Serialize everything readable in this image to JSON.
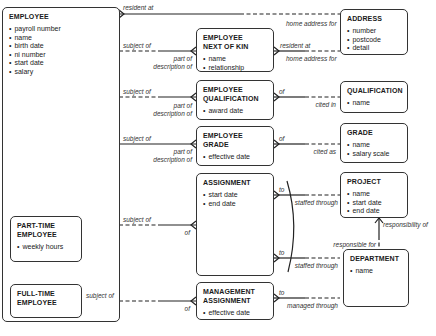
{
  "diagram": {
    "type": "entity-relationship",
    "entities": [
      {
        "id": "employee",
        "name": "EMPLOYEE",
        "attributes": [
          "payroll number",
          "name",
          "birth date",
          "ni number",
          "start date",
          "salary"
        ]
      },
      {
        "id": "part_time_employee",
        "name": "PART-TIME EMPLOYEE",
        "attributes": [
          "weekly hours"
        ]
      },
      {
        "id": "full_time_employee",
        "name": "FULL-TIME EMPLOYEE",
        "attributes": []
      },
      {
        "id": "employee_next_of_kin",
        "name": "EMPLOYEE NEXT OF KIN",
        "attributes": [
          "name",
          "relationship"
        ]
      },
      {
        "id": "employee_qualification",
        "name": "EMPLOYEE QUALIFICATION",
        "attributes": [
          "award date"
        ]
      },
      {
        "id": "employee_grade",
        "name": "EMPLOYEE GRADE",
        "attributes": [
          "effective date"
        ]
      },
      {
        "id": "assignment",
        "name": "ASSIGNMENT",
        "attributes": [
          "start date",
          "end date"
        ]
      },
      {
        "id": "management_assignment",
        "name": "MANAGEMENT ASSIGNMENT",
        "attributes": [
          "effective date"
        ]
      },
      {
        "id": "address",
        "name": "ADDRESS",
        "attributes": [
          "number",
          "postcode",
          "detail"
        ]
      },
      {
        "id": "qualification",
        "name": "QUALIFICATION",
        "attributes": [
          "name"
        ]
      },
      {
        "id": "grade",
        "name": "GRADE",
        "attributes": [
          "name",
          "salary scale"
        ]
      },
      {
        "id": "project",
        "name": "PROJECT",
        "attributes": [
          "name",
          "start date",
          "end date"
        ]
      },
      {
        "id": "department",
        "name": "DEPARTMENT",
        "attributes": [
          "name"
        ]
      }
    ],
    "relationships": [
      {
        "from": "employee",
        "to": "address",
        "from_label": "resident at",
        "to_label": "home address for"
      },
      {
        "from": "employee",
        "to": "employee_next_of_kin",
        "from_label": "subject of",
        "to_label": "part of description of"
      },
      {
        "from": "employee_next_of_kin",
        "to": "address",
        "from_label": "resident at",
        "to_label": "home address for"
      },
      {
        "from": "employee",
        "to": "employee_qualification",
        "from_label": "subject of",
        "to_label": "part of description of"
      },
      {
        "from": "employee_qualification",
        "to": "qualification",
        "from_label": "of",
        "to_label": "cited in"
      },
      {
        "from": "employee",
        "to": "employee_grade",
        "from_label": "subject of",
        "to_label": "part of description of"
      },
      {
        "from": "employee_grade",
        "to": "grade",
        "from_label": "of",
        "to_label": "cited as"
      },
      {
        "from": "employee",
        "to": "assignment",
        "from_label": "subject of",
        "to_label": "of"
      },
      {
        "from": "assignment",
        "to": "project",
        "from_label": "to",
        "to_label": "staffed through"
      },
      {
        "from": "assignment",
        "to": "department",
        "from_label": "to",
        "to_label": "staffed through"
      },
      {
        "from": "full_time_employee",
        "to": "management_assignment",
        "from_label": "subject of",
        "to_label": "of"
      },
      {
        "from": "management_assignment",
        "to": "department",
        "from_label": "to",
        "to_label": "managed through"
      },
      {
        "from": "project",
        "to": "department",
        "from_label": "responsibility of",
        "to_label": "responsible for"
      }
    ]
  },
  "labels": {
    "emp_addr_a": "resident at",
    "emp_addr_b": "home address for",
    "nok_addr_a": "resident at",
    "nok_addr_b": "home address for",
    "emp_nok_a": "subject of",
    "emp_nok_b1": "part of",
    "emp_nok_b2": "description of",
    "emp_qual_a": "subject of",
    "emp_qual_b1": "part of",
    "emp_qual_b2": "description of",
    "qual_a": "of",
    "qual_b": "cited in",
    "emp_grade_a": "subject of",
    "emp_grade_b1": "part of",
    "emp_grade_b2": "description of",
    "grade_a": "of",
    "grade_b": "cited as",
    "emp_asg_a": "subject of",
    "emp_asg_b": "of",
    "asg_proj_a": "to",
    "asg_proj_b": "staffed through",
    "asg_dept_a": "to",
    "asg_dept_b": "staffed through",
    "proj_dept_a": "responsibility of",
    "proj_dept_b": "responsible for",
    "fte_mgmt_a": "subject of",
    "fte_mgmt_b": "of",
    "mgmt_dept_a": "to",
    "mgmt_dept_b": "managed through"
  }
}
